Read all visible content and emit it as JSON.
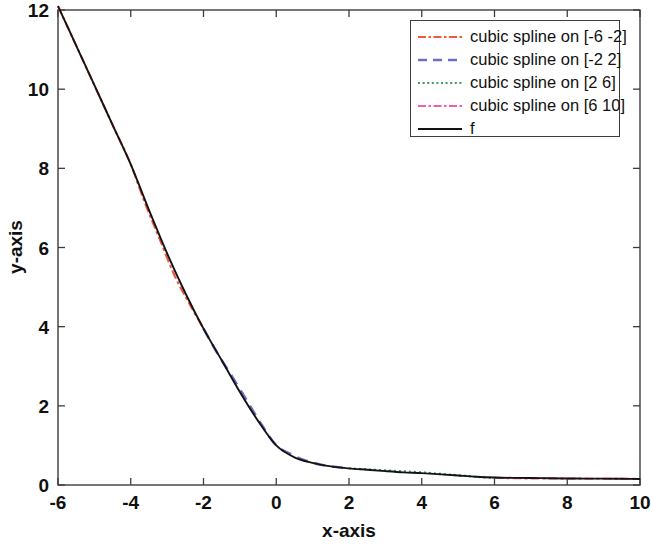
{
  "figure": {
    "width": 652,
    "height": 547,
    "background": "#ffffff"
  },
  "legend": {
    "position": "top-right",
    "box": {
      "x": 410,
      "y": 20,
      "width": 210,
      "height": 117
    },
    "entries": [
      {
        "label": "cubic spline on [-6 -2]",
        "color": "#f4553c",
        "style": "dash-dot"
      },
      {
        "label": "cubic spline on [-2 2]",
        "color": "#6b6fc4",
        "style": "dashed"
      },
      {
        "label": "cubic spline on [2 6]",
        "color": "#3f9a62",
        "style": "dotted"
      },
      {
        "label": "cubic spline on [6 10]",
        "color": "#f05fa6",
        "style": "dash-dot"
      },
      {
        "label": "f",
        "color": "#131313",
        "style": "solid"
      }
    ]
  },
  "chart_data": {
    "type": "line",
    "title": "",
    "xlabel": "x-axis",
    "ylabel": "y-axis",
    "xlim": [
      -6,
      10
    ],
    "ylim": [
      0,
      12
    ],
    "xticks": [
      -6,
      -4,
      -2,
      0,
      2,
      4,
      6,
      8,
      10
    ],
    "yticks": [
      0,
      2,
      4,
      6,
      8,
      10,
      12
    ],
    "xticklabels": [
      "-6",
      "-4",
      "-2",
      "0",
      "2",
      "4",
      "6",
      "8",
      "10"
    ],
    "yticklabels": [
      "0",
      "2",
      "4",
      "6",
      "8",
      "10",
      "12"
    ],
    "grid": false,
    "box": true,
    "tick_direction": "in",
    "series": [
      {
        "name": "cubic spline on [-6 -2]",
        "color": "#f4553c",
        "style": "dash-dot",
        "x": [
          -6,
          -5.6,
          -5.2,
          -4.8,
          -4.4,
          -4,
          -3.6,
          -3.2,
          -2.8,
          -2.4,
          -2
        ],
        "values": [
          12.1,
          11.3,
          10.5,
          9.7,
          8.9,
          8.1,
          7.1,
          6.2,
          5.3,
          4.6,
          3.95
        ]
      },
      {
        "name": "cubic spline on [-2 2]",
        "color": "#6b6fc4",
        "style": "dashed",
        "x": [
          -2,
          -1.6,
          -1.2,
          -0.8,
          -0.4,
          0,
          0.4,
          0.8,
          1.2,
          1.6,
          2
        ],
        "values": [
          3.95,
          3.3,
          2.72,
          2.12,
          1.52,
          1.0,
          0.78,
          0.62,
          0.52,
          0.46,
          0.42
        ]
      },
      {
        "name": "cubic spline on [2 6]",
        "color": "#3f9a62",
        "style": "dotted",
        "x": [
          2,
          2.4,
          2.8,
          3.2,
          3.6,
          4,
          4.4,
          4.8,
          5.2,
          5.6,
          6
        ],
        "values": [
          0.42,
          0.4,
          0.38,
          0.36,
          0.34,
          0.32,
          0.29,
          0.26,
          0.23,
          0.2,
          0.18
        ]
      },
      {
        "name": "cubic spline on [6 10]",
        "color": "#f05fa6",
        "style": "dash-dot",
        "x": [
          6,
          6.4,
          6.8,
          7.2,
          7.6,
          8,
          8.4,
          8.8,
          9.2,
          9.6,
          10
        ],
        "values": [
          0.18,
          0.175,
          0.17,
          0.168,
          0.165,
          0.162,
          0.16,
          0.158,
          0.156,
          0.154,
          0.152
        ]
      },
      {
        "name": "f",
        "color": "#131313",
        "style": "solid",
        "x": [
          -6,
          -5.5,
          -5,
          -4.5,
          -4,
          -3.5,
          -3,
          -2.5,
          -2,
          -1.5,
          -1,
          -0.5,
          0,
          0.5,
          1,
          1.5,
          2,
          2.5,
          3,
          3.5,
          4,
          4.5,
          5,
          5.5,
          6,
          6.5,
          7,
          7.5,
          8,
          8.5,
          9,
          9.5,
          10
        ],
        "values": [
          12.1,
          11.1,
          10.1,
          9.1,
          8.1,
          6.95,
          5.85,
          4.85,
          3.95,
          3.15,
          2.35,
          1.62,
          1.0,
          0.7,
          0.56,
          0.47,
          0.42,
          0.385,
          0.35,
          0.32,
          0.3,
          0.27,
          0.24,
          0.21,
          0.19,
          0.18,
          0.175,
          0.17,
          0.165,
          0.162,
          0.16,
          0.156,
          0.152
        ]
      }
    ]
  }
}
